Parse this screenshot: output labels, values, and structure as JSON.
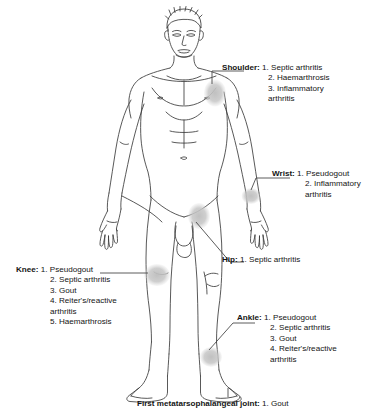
{
  "diagram": {
    "figure_label": "anterior view of standing adult male figure",
    "marker_color": "#c9c9c9",
    "line_color": "#4a4a4a",
    "annotations": [
      {
        "id": "shoulder",
        "label": "Shoulder:",
        "items": [
          "1. Septic arthritis",
          "2. Haemarthrosis",
          "3. Inflammatory",
          "arthritis"
        ],
        "wrapped_last": true
      },
      {
        "id": "wrist",
        "label": "Wrist:",
        "items": [
          "1. Pseudogout",
          "2. Inflammatory",
          "arthritis"
        ],
        "wrapped_last": true
      },
      {
        "id": "hip",
        "label": "Hip:",
        "items": [
          "1. Septic arthritis"
        ],
        "wrapped_last": false
      },
      {
        "id": "knee",
        "label": "Knee:",
        "items": [
          "1. Pseudogout",
          "2. Septic arthritis",
          "3. Gout",
          "4. Reiter's/reactive",
          "arthritis",
          "5. Haemarthrosis"
        ],
        "wrapped_last": false
      },
      {
        "id": "ankle",
        "label": "Ankle:",
        "items": [
          "1. Pseudogout",
          "2. Septic arthritis",
          "3. Gout",
          "4. Reiter's/reactive",
          "arthritis"
        ],
        "wrapped_last": true
      },
      {
        "id": "mtp",
        "label": "First metatarsophalangeal joint:",
        "items": [
          "1. Gout"
        ],
        "wrapped_last": false
      }
    ]
  }
}
